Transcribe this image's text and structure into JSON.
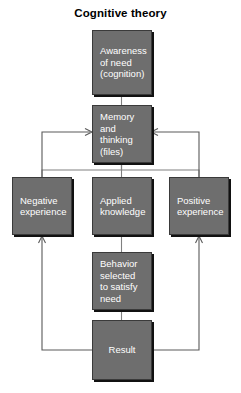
{
  "title": "Cognitive theory",
  "diagram": {
    "type": "flowchart",
    "node_fill_color": "#6e6e6e",
    "node_text_color": "#ffffff",
    "node_border_color": "#3a3a3a",
    "edge_color": "#808080",
    "background_color": "#ffffff",
    "nodes": [
      {
        "id": "awareness",
        "label": "Awareness\nof need\n(cognition)"
      },
      {
        "id": "memory",
        "label": "Memory\nand\nthinking\n(files)"
      },
      {
        "id": "negative",
        "label": "Negative\nexperience"
      },
      {
        "id": "applied",
        "label": "Applied\nknowledge"
      },
      {
        "id": "positive",
        "label": "Positive\nexperience"
      },
      {
        "id": "behavior",
        "label": "Behavior\nselected\nto satisfy\nneed"
      },
      {
        "id": "result",
        "label": "Result"
      }
    ],
    "edges": [
      {
        "from": "awareness",
        "to": "memory",
        "arrow": false
      },
      {
        "from": "memory",
        "to": "negative",
        "arrow": false
      },
      {
        "from": "memory",
        "to": "applied",
        "arrow": false
      },
      {
        "from": "memory",
        "to": "positive",
        "arrow": false
      },
      {
        "from": "applied",
        "to": "behavior",
        "arrow": false
      },
      {
        "from": "behavior",
        "to": "result",
        "arrow": false
      },
      {
        "from": "result",
        "to": "negative",
        "arrow": true
      },
      {
        "from": "result",
        "to": "positive",
        "arrow": true
      },
      {
        "from": "negative",
        "to": "memory",
        "arrow": true
      },
      {
        "from": "positive",
        "to": "memory",
        "arrow": true
      }
    ]
  }
}
